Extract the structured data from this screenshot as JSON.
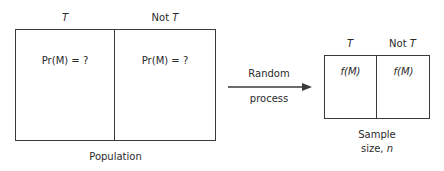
{
  "population": {
    "columns": [
      {
        "label_prefix": "",
        "label_var": "T"
      },
      {
        "label_prefix": "Not ",
        "label_var": "T"
      }
    ],
    "cells": [
      "Pr(M) = ?",
      "Pr(M) = ?"
    ],
    "caption": "Population"
  },
  "arrow": {
    "label_top": "Random",
    "label_bottom": "process"
  },
  "sample": {
    "columns": [
      {
        "label_prefix": "",
        "label_var": "T"
      },
      {
        "label_prefix": "Not ",
        "label_var": "T"
      }
    ],
    "cells": [
      "f(M)",
      "f(M)"
    ],
    "caption_line1": "Sample",
    "caption_line2_prefix": "size, ",
    "caption_line2_var": "n"
  }
}
